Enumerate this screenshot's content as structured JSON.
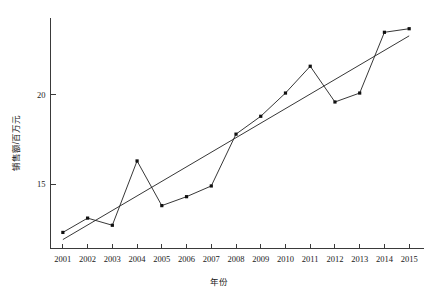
{
  "chart_data": {
    "type": "line",
    "title": "",
    "xlabel": "年份",
    "ylabel": "销售额/百万元",
    "categories": [
      "2001",
      "2002",
      "2003",
      "2004",
      "2005",
      "2006",
      "2007",
      "2008",
      "2009",
      "2010",
      "2011",
      "2012",
      "2013",
      "2014",
      "2015"
    ],
    "x": [
      2001,
      2002,
      2003,
      2004,
      2005,
      2006,
      2007,
      2008,
      2009,
      2010,
      2011,
      2012,
      2013,
      2014,
      2015
    ],
    "xlim": [
      2000.5,
      2015.6
    ],
    "ylim": [
      11.4,
      24.3
    ],
    "yticks": [
      15,
      20
    ],
    "ytick_labels": [
      "15",
      "20"
    ],
    "xtick_labels": [
      "2001",
      "2002",
      "2003",
      "2004",
      "2005",
      "2006",
      "2007",
      "2008",
      "2009",
      "2010",
      "2011",
      "2012",
      "2013",
      "2014",
      "2015"
    ],
    "grid": false,
    "legend": null,
    "marker": "square",
    "series": [
      {
        "name": "销售额",
        "kind": "markers-line",
        "values": [
          12.3,
          13.1,
          12.7,
          16.3,
          13.8,
          14.3,
          14.9,
          17.8,
          18.8,
          20.1,
          21.6,
          19.6,
          20.1,
          23.5,
          23.7
        ]
      },
      {
        "name": "趋势线",
        "kind": "trend",
        "endpoints": [
          {
            "x": 2001,
            "y": 11.9
          },
          {
            "x": 2015,
            "y": 23.3
          }
        ]
      }
    ]
  },
  "figure": {
    "line_color": "#202020",
    "marker_color": "#101010",
    "axis_color": "#3a3a3a",
    "background": "#ffffff"
  }
}
